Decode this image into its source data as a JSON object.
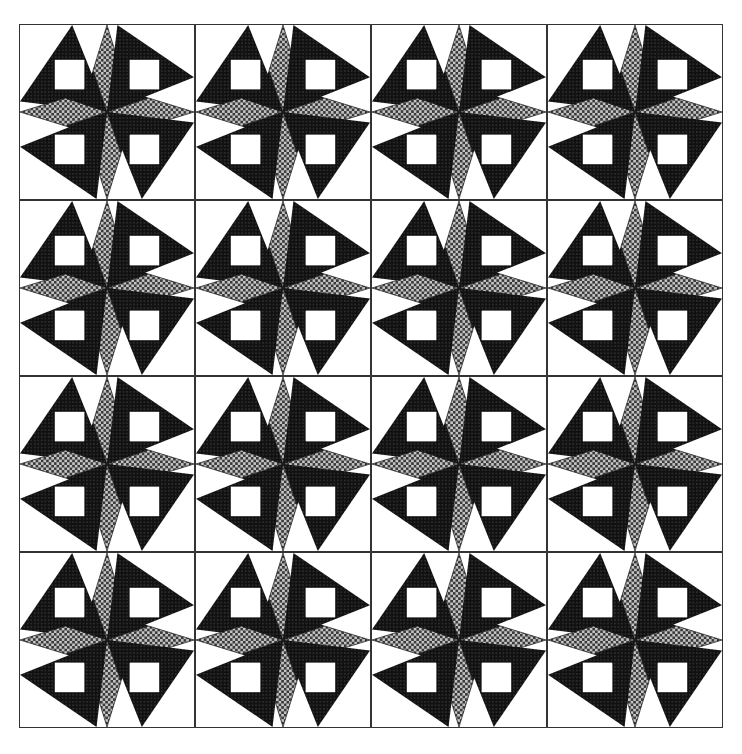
{
  "title": "Quilt block pattern",
  "grid": {
    "rows": 4,
    "cols": 4,
    "tile_size": 176
  },
  "colors": {
    "background": "#ffffff",
    "dark": "#1a1a1a",
    "gray_pattern_dark": "#3a3a3a",
    "gray_pattern_light": "#bdbdbd",
    "border": "#333333"
  },
  "block": {
    "name": "eight-point star with dark kites and white squares",
    "center_star_arms": 8,
    "white_squares_per_block": 4
  }
}
